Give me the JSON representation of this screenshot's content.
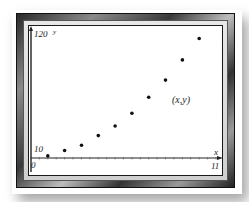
{
  "chart_data": {
    "type": "scatter",
    "title": "",
    "xlabel": "x",
    "ylabel": "y",
    "xlim": [
      0,
      11
    ],
    "ylim": [
      0,
      120
    ],
    "x_tick_labels": [
      "0",
      "11"
    ],
    "y_tick_labels": [
      "10",
      "120"
    ],
    "annotation": "(x,y)",
    "grid": false,
    "legend": null,
    "series": [
      {
        "name": "(x,y)",
        "x": [
          1,
          2,
          3,
          4,
          5,
          6,
          7,
          8,
          9,
          10
        ],
        "y": [
          2,
          7,
          12,
          21,
          30,
          42,
          57,
          73,
          92,
          112
        ]
      }
    ]
  },
  "labels": {
    "y_axis_name": "y",
    "x_axis_name": "x",
    "y_max": "120",
    "y_min_label": "10",
    "x_min": "0",
    "x_max": "11",
    "annotation": "(x,y)"
  },
  "colors": {
    "point": "#111111",
    "axis": "#222222"
  }
}
